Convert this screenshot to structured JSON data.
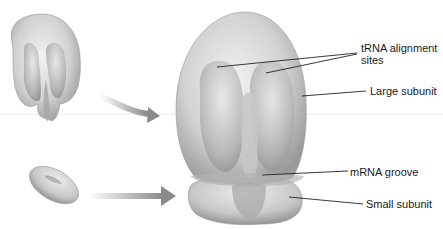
{
  "diagram": {
    "labels": {
      "trna_line1": "tRNA alignment",
      "trna_line2": "sites",
      "large_subunit": "Large subunit",
      "mrna_groove": "mRNA groove",
      "small_subunit": "Small subunit"
    },
    "components": [
      {
        "name": "large-subunit-separate",
        "position": "top-left"
      },
      {
        "name": "small-subunit-separate",
        "position": "bottom-left"
      },
      {
        "name": "assembled-ribosome",
        "position": "center"
      }
    ],
    "arrows": [
      {
        "from": "large-subunit-separate",
        "to": "assembled-ribosome"
      },
      {
        "from": "small-subunit-separate",
        "to": "assembled-ribosome"
      }
    ],
    "colors": {
      "body_light": "#e6e6e6",
      "body_mid": "#bdbdbd",
      "body_dark": "#8f8f8f",
      "arrow": "#8a8a8a",
      "leader": "#222222"
    }
  }
}
